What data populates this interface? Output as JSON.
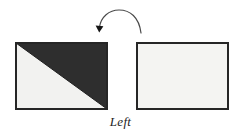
{
  "figure": {
    "caption": "Left",
    "background_color": "#ffffff",
    "shapes": {
      "left_rectangle": {
        "name": "half-shaded-rectangle",
        "x": 15,
        "y": 42,
        "width": 93,
        "height": 68,
        "border_color": "#262626",
        "border_width": 2,
        "light_fill": "#f2f2f0",
        "dark_fill": "#2e2e2e",
        "diagonal": "top-left-to-bottom-right",
        "shaded_region": "upper-right-triangle"
      },
      "right_rectangle": {
        "name": "blank-rectangle",
        "x": 136,
        "y": 42,
        "width": 93,
        "height": 68,
        "border_color": "#262626",
        "border_width": 2,
        "fill": "#f4f4f2"
      },
      "arrow": {
        "name": "curved-rotation-arrow",
        "direction": "right-to-left",
        "start_x": 141,
        "start_y": 33,
        "end_x": 99,
        "end_y": 29,
        "apex_x": 120,
        "apex_y": 12,
        "stroke_color": "#4a4a4a",
        "stroke_width": 1.2,
        "head_color": "#1a1a1a"
      }
    }
  }
}
